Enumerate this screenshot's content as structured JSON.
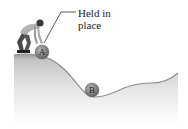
{
  "diagram": {
    "annotation": {
      "line1": "Held in",
      "line2": "place"
    },
    "balls": [
      {
        "label": "A",
        "description": "ball held at top of hill"
      },
      {
        "label": "B",
        "description": "ball resting in valley"
      }
    ],
    "figure": "person-holding-ball",
    "terrain": "hill-valley-profile",
    "colors": {
      "ground_top": "#8a8a8a",
      "ground_fade": "#ffffff",
      "ball": "#7a7a7a",
      "leader_line": "#333333"
    }
  }
}
